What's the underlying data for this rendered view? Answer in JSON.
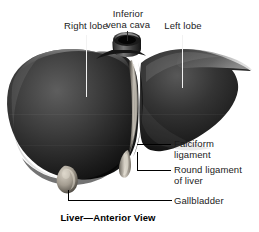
{
  "figure": {
    "caption": "Liver—Anterior View",
    "subject": "liver",
    "view": "anterior",
    "palette": {
      "background": "#ffffff",
      "text": "#1b1b1b",
      "caption_text": "#000000",
      "leader_dark": "#000000",
      "leader_light": "#f2f2f2",
      "organ_dark": "#111111",
      "organ_mid": "#3a3a3a",
      "organ_light": "#6e6e6e",
      "highlight": "#c9c4bb",
      "gallbladder": "#b9b2a6"
    }
  },
  "labels": [
    {
      "id": "right-lobe",
      "text": "Right lobe",
      "align": "center",
      "leader": "vertical-light"
    },
    {
      "id": "inferior-vena-cava",
      "text": "Inferior\nvena cava",
      "align": "center",
      "leader": "vertical-dark"
    },
    {
      "id": "left-lobe",
      "text": "Left lobe",
      "align": "center",
      "leader": "vertical-light"
    },
    {
      "id": "falciform-ligament",
      "text": "Falciform\nligament",
      "align": "left",
      "leader": "horizontal-dark"
    },
    {
      "id": "round-ligament-of-liver",
      "text": "Round ligament\nof liver",
      "align": "left",
      "leader": "elbow-dark"
    },
    {
      "id": "gallbladder",
      "text": "Gallbladder",
      "align": "left",
      "leader": "elbow-dark"
    }
  ]
}
